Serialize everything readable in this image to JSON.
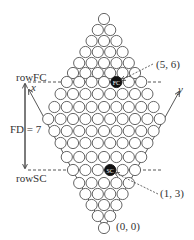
{
  "diagram": {
    "row_counts": [
      1,
      2,
      3,
      4,
      5,
      6,
      7,
      8,
      9,
      10,
      9,
      8,
      7,
      6,
      5,
      4,
      3,
      2,
      1
    ],
    "row_y": [
      19,
      30,
      41,
      52,
      63,
      73,
      82,
      94,
      107,
      119,
      131,
      143,
      157,
      170,
      183,
      194,
      205,
      216,
      228
    ],
    "center_x": 104,
    "spacing_x": 12.4,
    "radius": 5.6,
    "stroke_color": "#555555",
    "filled_color": "#111111",
    "filled_cells": [
      {
        "row": 6,
        "index": 4,
        "label": "FC"
      },
      {
        "row": 13,
        "index": 3,
        "label": "SC"
      }
    ],
    "row_fc_y": 82,
    "row_sc_y": 170
  },
  "labels": {
    "row_fc": "rowFC",
    "row_sc": "rowSC",
    "fd": "FD = 7",
    "x_axis": "x",
    "y_axis": "y",
    "fc_coord": "(5, 6)",
    "sc_coord": "(1, 3)",
    "origin_coord": "(0, 0)"
  }
}
